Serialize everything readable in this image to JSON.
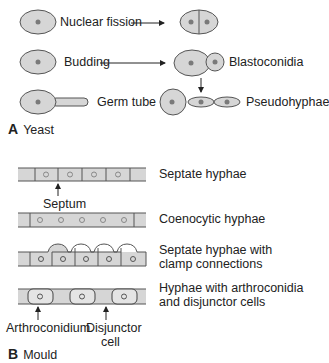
{
  "colors": {
    "cell_fill": "#d6d6d6",
    "cell_stroke": "#555555",
    "nucleus": "#7a7a7a",
    "text": "#222222"
  },
  "panel_a": {
    "letter": "A",
    "title": "Yeast",
    "rows": [
      {
        "process": "Nuclear fission",
        "result": ""
      },
      {
        "process": "Budding",
        "result": "Blastoconidia"
      },
      {
        "process": "Germ tube",
        "result": "Pseudohyphae"
      }
    ]
  },
  "panel_b": {
    "letter": "B",
    "title": "Mould",
    "hyphae": [
      {
        "label": "Septate hyphae",
        "annotation": "Septum"
      },
      {
        "label": "Coenocytic hyphae"
      },
      {
        "label_line1": "Septate hyphae with",
        "label_line2": "clamp connections"
      },
      {
        "label_line1": "Hyphae with arthroconidia",
        "label_line2": "and disjunctor cells",
        "annotations": [
          "Arthroconidium",
          "Disjunctor",
          "cell"
        ]
      }
    ]
  }
}
